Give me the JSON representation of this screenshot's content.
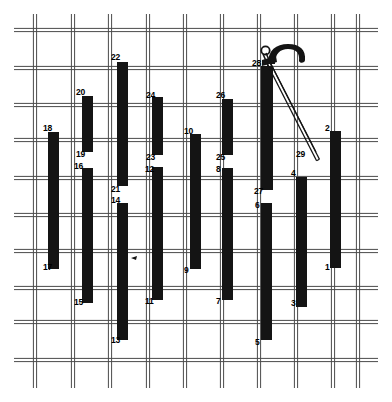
{
  "figure": {
    "width": 392,
    "height": 402,
    "background_color": "#ffffff",
    "grid": {
      "line_color": "#4a4a4a",
      "line_style": "double-line mesh",
      "line_width": 1,
      "pair_gap": 3.2,
      "vertical_x": [
        35,
        73,
        110,
        148,
        185,
        222,
        259,
        296,
        333,
        358
      ],
      "horizontal_y": [
        30,
        68,
        105,
        140,
        178,
        215,
        251,
        288,
        322,
        360
      ],
      "frame": {
        "x": 14,
        "y": 14,
        "w": 364,
        "h": 374
      }
    },
    "bar_color": "#141414",
    "bars": [
      {
        "id": "bar-1",
        "x": 330,
        "y": 131,
        "w": 11,
        "h": 137,
        "top_label": null,
        "bottom_label": "1"
      },
      {
        "id": "bar-2",
        "x": 330,
        "y": 131,
        "w": 11,
        "h": 137,
        "top_label": "2",
        "bottom_label": null
      },
      {
        "id": "bar-3",
        "x": 296,
        "y": 177,
        "w": 11,
        "h": 130,
        "top_label": null,
        "bottom_label": "3"
      },
      {
        "id": "bar-4",
        "x": 296,
        "y": 177,
        "w": 11,
        "h": 130,
        "top_label": "4",
        "bottom_label": null
      },
      {
        "id": "bar-5",
        "x": 261,
        "y": 203,
        "w": 11,
        "h": 137,
        "top_label": null,
        "bottom_label": "5"
      },
      {
        "id": "bar-6",
        "x": 261,
        "y": 203,
        "w": 11,
        "h": 137,
        "top_label": "6",
        "bottom_label": null
      },
      {
        "id": "bar-7",
        "x": 222,
        "y": 168,
        "w": 11,
        "h": 132,
        "top_label": null,
        "bottom_label": "7"
      },
      {
        "id": "bar-8",
        "x": 222,
        "y": 168,
        "w": 11,
        "h": 132,
        "top_label": "8",
        "bottom_label": null
      },
      {
        "id": "bar-9",
        "x": 190,
        "y": 134,
        "w": 11,
        "h": 135,
        "top_label": null,
        "bottom_label": "9"
      },
      {
        "id": "bar-10",
        "x": 190,
        "y": 134,
        "w": 11,
        "h": 135,
        "top_label": "10",
        "bottom_label": null
      },
      {
        "id": "bar-11",
        "x": 152,
        "y": 167,
        "w": 11,
        "h": 133,
        "top_label": null,
        "bottom_label": "11"
      },
      {
        "id": "bar-12",
        "x": 152,
        "y": 167,
        "w": 11,
        "h": 133,
        "top_label": "12",
        "bottom_label": null
      },
      {
        "id": "bar-13",
        "x": 117,
        "y": 203,
        "w": 11,
        "h": 137,
        "top_label": null,
        "bottom_label": "13"
      },
      {
        "id": "bar-14",
        "x": 117,
        "y": 203,
        "w": 11,
        "h": 137,
        "top_label": "14",
        "bottom_label": null
      },
      {
        "id": "bar-15",
        "x": 82,
        "y": 168,
        "w": 11,
        "h": 135,
        "top_label": null,
        "bottom_label": "15"
      },
      {
        "id": "bar-16",
        "x": 82,
        "y": 168,
        "w": 11,
        "h": 135,
        "top_label": "16",
        "bottom_label": null
      },
      {
        "id": "bar-17",
        "x": 48,
        "y": 132,
        "w": 11,
        "h": 137,
        "top_label": null,
        "bottom_label": "17"
      },
      {
        "id": "bar-18",
        "x": 48,
        "y": 132,
        "w": 11,
        "h": 137,
        "top_label": "18",
        "bottom_label": null
      },
      {
        "id": "bar-19",
        "x": 82,
        "y": 96,
        "w": 11,
        "h": 56,
        "top_label": null,
        "bottom_label": "19"
      },
      {
        "id": "bar-20",
        "x": 82,
        "y": 96,
        "w": 11,
        "h": 56,
        "top_label": "20",
        "bottom_label": null
      },
      {
        "id": "bar-21",
        "x": 117,
        "y": 62,
        "w": 11,
        "h": 124,
        "top_label": null,
        "bottom_label": "21"
      },
      {
        "id": "bar-22",
        "x": 117,
        "y": 62,
        "w": 11,
        "h": 124,
        "top_label": "22",
        "bottom_label": null
      },
      {
        "id": "bar-23",
        "x": 152,
        "y": 97,
        "w": 11,
        "h": 58,
        "top_label": null,
        "bottom_label": "23"
      },
      {
        "id": "bar-24",
        "x": 152,
        "y": 97,
        "w": 11,
        "h": 58,
        "top_label": "24",
        "bottom_label": null
      },
      {
        "id": "bar-25",
        "x": 222,
        "y": 99,
        "w": 11,
        "h": 56,
        "top_label": null,
        "bottom_label": "25"
      },
      {
        "id": "bar-26",
        "x": 222,
        "y": 99,
        "w": 11,
        "h": 56,
        "top_label": "26",
        "bottom_label": null
      },
      {
        "id": "bar-27",
        "x": 261,
        "y": 66,
        "w": 12,
        "h": 124,
        "top_label": null,
        "bottom_label": "27"
      },
      {
        "id": "bar-28",
        "x": 261,
        "y": 66,
        "w": 12,
        "h": 124,
        "top_label": "28",
        "bottom_label": null
      }
    ],
    "labels": [
      {
        "text": "18",
        "x": 43,
        "y": 124,
        "for": "bar-18"
      },
      {
        "text": "17",
        "x": 43,
        "y": 263,
        "for": "bar-17"
      },
      {
        "text": "20",
        "x": 76,
        "y": 88,
        "for": "bar-20"
      },
      {
        "text": "19",
        "x": 76,
        "y": 150,
        "for": "bar-19"
      },
      {
        "text": "16",
        "x": 74,
        "y": 162,
        "for": "bar-16"
      },
      {
        "text": "15",
        "x": 74,
        "y": 298,
        "for": "bar-15"
      },
      {
        "text": "22",
        "x": 111,
        "y": 53,
        "for": "bar-22"
      },
      {
        "text": "21",
        "x": 111,
        "y": 185,
        "for": "bar-21"
      },
      {
        "text": "14",
        "x": 111,
        "y": 196,
        "for": "bar-14"
      },
      {
        "text": "13",
        "x": 111,
        "y": 336,
        "for": "bar-13"
      },
      {
        "text": "24",
        "x": 146,
        "y": 91,
        "for": "bar-24"
      },
      {
        "text": "23",
        "x": 146,
        "y": 153,
        "for": "bar-23"
      },
      {
        "text": "12",
        "x": 145,
        "y": 165,
        "for": "bar-12"
      },
      {
        "text": "11",
        "x": 145,
        "y": 297,
        "for": "bar-11"
      },
      {
        "text": "10",
        "x": 184,
        "y": 127,
        "for": "bar-10"
      },
      {
        "text": "9",
        "x": 184,
        "y": 266,
        "for": "bar-9"
      },
      {
        "text": "26",
        "x": 216,
        "y": 91,
        "for": "bar-26"
      },
      {
        "text": "25",
        "x": 216,
        "y": 153,
        "for": "bar-25"
      },
      {
        "text": "8",
        "x": 216,
        "y": 165,
        "for": "bar-8"
      },
      {
        "text": "7",
        "x": 216,
        "y": 297,
        "for": "bar-7"
      },
      {
        "text": "28",
        "x": 252,
        "y": 59,
        "for": "bar-28"
      },
      {
        "text": "27",
        "x": 254,
        "y": 187,
        "for": "bar-27"
      },
      {
        "text": "6",
        "x": 255,
        "y": 201,
        "for": "bar-6"
      },
      {
        "text": "5",
        "x": 255,
        "y": 338,
        "for": "bar-5"
      },
      {
        "text": "4",
        "x": 291,
        "y": 169,
        "for": "bar-4"
      },
      {
        "text": "3",
        "x": 291,
        "y": 299,
        "for": "bar-3"
      },
      {
        "text": "2",
        "x": 325,
        "y": 124,
        "for": "bar-2"
      },
      {
        "text": "1",
        "x": 325,
        "y": 263,
        "for": "bar-1"
      },
      {
        "text": "29",
        "x": 296,
        "y": 150,
        "for": "rod-29"
      }
    ],
    "tool": {
      "name": "hook-handle-tool",
      "color": "#141414",
      "ring_center": [
        265.5,
        50.5
      ],
      "ring_radius": 4.2,
      "handle_note": "curved hook head at top of bar 28",
      "rod": {
        "id": "rod-29",
        "label": "29",
        "from": [
          268,
          62
        ],
        "to": [
          318,
          160
        ],
        "thickness": 3.2,
        "style": "thin double-line diagonal rod"
      }
    },
    "tick_mark": {
      "x": 131,
      "y": 258,
      "note": "small pointer tick on bar 14"
    }
  }
}
